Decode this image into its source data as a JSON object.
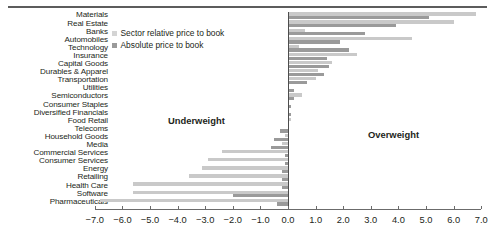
{
  "chart_data": {
    "type": "bar",
    "orientation": "horizontal",
    "title": "",
    "subtitle": "",
    "xlabel": "",
    "ylabel": "",
    "xlim": [
      -7.0,
      7.0
    ],
    "xticks": [
      -7.0,
      -6.0,
      -5.0,
      -4.0,
      -3.0,
      -2.0,
      -1.0,
      0.0,
      1.0,
      2.0,
      3.0,
      4.0,
      5.0,
      6.0,
      7.0
    ],
    "xticklabels": [
      "-7.0",
      "-6.0",
      "-5.0",
      "-4.0",
      "-3.0",
      "-2.0",
      "-1.0",
      "0.0",
      "1.0",
      "2.0",
      "3.0",
      "4.0",
      "5.0",
      "6.0",
      "7.0"
    ],
    "grid": false,
    "legend_position": "upper-left-inside",
    "categories": [
      "Materials",
      "Real Estate",
      "Banks",
      "Automobiles",
      "Technology",
      "Insurance",
      "Capital Goods",
      "Durables & Apparel",
      "Transportation",
      "Utilities",
      "Semiconductors",
      "Consumer Staples",
      "Diversified Financials",
      "Food Retail",
      "Telecoms",
      "Household Goods",
      "Media",
      "Commercial Services",
      "Consumer Services",
      "Energy",
      "Retailing",
      "Health Care",
      "Software",
      "Pharmaceuticals"
    ],
    "series": [
      {
        "name": "Sector relative price to book",
        "color": "#c9c9c9",
        "values": [
          6.8,
          6.0,
          0.6,
          4.5,
          0.4,
          2.5,
          1.6,
          1.1,
          1.0,
          0.0,
          0.5,
          0.0,
          0.0,
          0.1,
          0.0,
          -0.1,
          -0.2,
          -2.4,
          -2.9,
          -3.1,
          -3.6,
          -5.6,
          -5.6,
          -6.8
        ]
      },
      {
        "name": "Absolute price to book",
        "color": "#9a9a9a",
        "values": [
          5.1,
          3.9,
          2.8,
          1.9,
          2.2,
          1.4,
          1.5,
          1.3,
          0.7,
          0.2,
          0.2,
          0.1,
          0.1,
          0.0,
          -0.3,
          -0.5,
          -0.6,
          -0.1,
          -0.1,
          -0.2,
          -0.2,
          -0.2,
          -2.0,
          -0.4
        ]
      }
    ],
    "annotations": [
      {
        "text": "Underweight",
        "x": -4.3,
        "side": "left"
      },
      {
        "text": "Overweight",
        "x": 2.9,
        "side": "right"
      }
    ]
  },
  "legend": {
    "items": [
      {
        "label": "Sector relative price to book",
        "swatch": "rel"
      },
      {
        "label": "Absolute price to book",
        "swatch": "abs"
      }
    ]
  },
  "annotations": {
    "underweight": "Underweight",
    "overweight": "Overweight"
  }
}
